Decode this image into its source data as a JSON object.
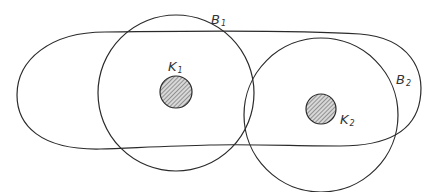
{
  "diagram": {
    "title": "",
    "shapes": [
      {
        "id": "stadium",
        "label": "",
        "description": "elongated closed region enclosing both obstacles"
      },
      {
        "id": "ball-1",
        "label": "B",
        "subscript": "1",
        "description": "circle around obstacle K1"
      },
      {
        "id": "ball-2",
        "label": "B",
        "subscript": "2",
        "description": "circle around obstacle K2"
      },
      {
        "id": "obstacle-1",
        "label": "K",
        "subscript": "1",
        "fill": "hatched"
      },
      {
        "id": "obstacle-2",
        "label": "K",
        "subscript": "2",
        "fill": "hatched"
      }
    ]
  },
  "labels": {
    "b1": {
      "main": "B",
      "sub": "1"
    },
    "b2": {
      "main": "B",
      "sub": "2"
    },
    "k1": {
      "main": "K",
      "sub": "1"
    },
    "k2": {
      "main": "K",
      "sub": "2"
    }
  },
  "colors": {
    "stroke": "#2a2a2a",
    "hatch": "#555555",
    "background": "#ffffff"
  }
}
